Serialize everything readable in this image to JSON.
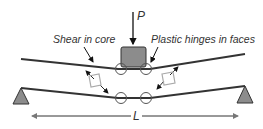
{
  "diagram": {
    "labels": {
      "load": "P",
      "span": "L",
      "shear_core": "Shear in core",
      "plastic_hinges": "Plastic hinges in faces"
    },
    "colors": {
      "face_line": "#333333",
      "load_block": "#8c8c8c",
      "support": "#8c8c8c",
      "hinge_circle": "#555555",
      "dimension": "#777777",
      "shear_element": "#aaaaaa"
    },
    "elements": {
      "top_face": [
        [
          21,
          59
        ],
        [
          118,
          69
        ],
        [
          150,
          69
        ],
        [
          245,
          54
        ]
      ],
      "bottom_face": [
        [
          21,
          88
        ],
        [
          118,
          98
        ],
        [
          150,
          98
        ],
        [
          245,
          86
        ]
      ],
      "hinges": [
        [
          121,
          69
        ],
        [
          146,
          69
        ],
        [
          121,
          98
        ],
        [
          146,
          98
        ]
      ],
      "supports": [
        [
          21,
          104
        ],
        [
          245,
          104
        ]
      ],
      "load_block": {
        "x": 121,
        "y": 47,
        "w": 25,
        "h": 20
      }
    }
  }
}
